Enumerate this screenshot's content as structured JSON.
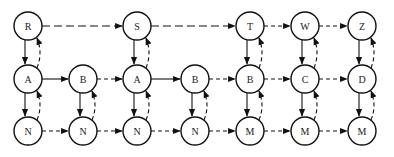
{
  "diagram": {
    "node_radius": 14,
    "nodes": [
      {
        "id": "r1c1",
        "label": "R",
        "x": 28,
        "y": 26
      },
      {
        "id": "r1c3",
        "label": "S",
        "x": 137,
        "y": 26
      },
      {
        "id": "r1c5",
        "label": "T",
        "x": 250,
        "y": 26
      },
      {
        "id": "r1c6",
        "label": "W",
        "x": 305,
        "y": 26
      },
      {
        "id": "r1c7",
        "label": "Z",
        "x": 362,
        "y": 26
      },
      {
        "id": "r2c1",
        "label": "A",
        "x": 28,
        "y": 79
      },
      {
        "id": "r2c2",
        "label": "B",
        "x": 83,
        "y": 79
      },
      {
        "id": "r2c3",
        "label": "A",
        "x": 137,
        "y": 79
      },
      {
        "id": "r2c4",
        "label": "B",
        "x": 195,
        "y": 79
      },
      {
        "id": "r2c5",
        "label": "B",
        "x": 250,
        "y": 79
      },
      {
        "id": "r2c6",
        "label": "C",
        "x": 305,
        "y": 79
      },
      {
        "id": "r2c7",
        "label": "D",
        "x": 362,
        "y": 79
      },
      {
        "id": "r3c1",
        "label": "N",
        "x": 28,
        "y": 131
      },
      {
        "id": "r3c2",
        "label": "N",
        "x": 83,
        "y": 131
      },
      {
        "id": "r3c3",
        "label": "N",
        "x": 137,
        "y": 131
      },
      {
        "id": "r3c4",
        "label": "N",
        "x": 195,
        "y": 131
      },
      {
        "id": "r3c5",
        "label": "M",
        "x": 250,
        "y": 131
      },
      {
        "id": "r3c6",
        "label": "M",
        "x": 305,
        "y": 131
      },
      {
        "id": "r3c7",
        "label": "M",
        "x": 362,
        "y": 131
      }
    ],
    "edges": [
      {
        "from": "r1c1",
        "to": "r1c3",
        "style": "long-dash",
        "kind": "horizontal"
      },
      {
        "from": "r1c3",
        "to": "r1c5",
        "style": "long-dash",
        "kind": "horizontal"
      },
      {
        "from": "r1c5",
        "to": "r1c6",
        "style": "short-dash",
        "kind": "horizontal"
      },
      {
        "from": "r1c6",
        "to": "r1c7",
        "style": "short-dash",
        "kind": "horizontal"
      },
      {
        "from": "r2c1",
        "to": "r2c2",
        "style": "solid",
        "kind": "horizontal"
      },
      {
        "from": "r2c2",
        "to": "r2c3",
        "style": "short-dash",
        "kind": "horizontal"
      },
      {
        "from": "r2c3",
        "to": "r2c4",
        "style": "solid",
        "kind": "horizontal"
      },
      {
        "from": "r2c4",
        "to": "r2c5",
        "style": "short-dash",
        "kind": "horizontal"
      },
      {
        "from": "r2c5",
        "to": "r2c6",
        "style": "short-dash",
        "kind": "horizontal"
      },
      {
        "from": "r2c6",
        "to": "r2c7",
        "style": "short-dash",
        "kind": "horizontal"
      },
      {
        "from": "r3c1",
        "to": "r3c2",
        "style": "short-dash",
        "kind": "horizontal"
      },
      {
        "from": "r3c2",
        "to": "r3c3",
        "style": "short-dash",
        "kind": "horizontal"
      },
      {
        "from": "r3c3",
        "to": "r3c4",
        "style": "short-dash",
        "kind": "horizontal"
      },
      {
        "from": "r3c4",
        "to": "r3c5",
        "style": "short-dash",
        "kind": "horizontal"
      },
      {
        "from": "r3c5",
        "to": "r3c6",
        "style": "short-dash",
        "kind": "horizontal"
      },
      {
        "from": "r3c6",
        "to": "r3c7",
        "style": "short-dash",
        "kind": "horizontal"
      },
      {
        "from": "r1c1",
        "to": "r2c1",
        "style": "solid",
        "kind": "down"
      },
      {
        "from": "r2c1",
        "to": "r1c1",
        "style": "curve-dash",
        "kind": "up"
      },
      {
        "from": "r2c1",
        "to": "r3c1",
        "style": "solid",
        "kind": "down"
      },
      {
        "from": "r3c1",
        "to": "r2c1",
        "style": "curve-dash",
        "kind": "up"
      },
      {
        "from": "r2c2",
        "to": "r3c2",
        "style": "solid",
        "kind": "down"
      },
      {
        "from": "r3c2",
        "to": "r2c2",
        "style": "curve-dash",
        "kind": "up"
      },
      {
        "from": "r1c3",
        "to": "r2c3",
        "style": "solid",
        "kind": "down"
      },
      {
        "from": "r2c3",
        "to": "r1c3",
        "style": "curve-dash",
        "kind": "up"
      },
      {
        "from": "r2c3",
        "to": "r3c3",
        "style": "solid",
        "kind": "down"
      },
      {
        "from": "r3c3",
        "to": "r2c3",
        "style": "curve-dash",
        "kind": "up"
      },
      {
        "from": "r2c4",
        "to": "r3c4",
        "style": "solid",
        "kind": "down"
      },
      {
        "from": "r3c4",
        "to": "r2c4",
        "style": "curve-dash",
        "kind": "up"
      },
      {
        "from": "r1c5",
        "to": "r2c5",
        "style": "solid",
        "kind": "down"
      },
      {
        "from": "r2c5",
        "to": "r1c5",
        "style": "curve-dash",
        "kind": "up"
      },
      {
        "from": "r2c5",
        "to": "r3c5",
        "style": "solid",
        "kind": "down"
      },
      {
        "from": "r3c5",
        "to": "r2c5",
        "style": "curve-dash",
        "kind": "up"
      },
      {
        "from": "r1c6",
        "to": "r2c6",
        "style": "solid",
        "kind": "down"
      },
      {
        "from": "r2c6",
        "to": "r1c6",
        "style": "curve-dash",
        "kind": "up"
      },
      {
        "from": "r2c6",
        "to": "r3c6",
        "style": "solid",
        "kind": "down"
      },
      {
        "from": "r3c6",
        "to": "r2c6",
        "style": "curve-dash",
        "kind": "up"
      },
      {
        "from": "r1c7",
        "to": "r2c7",
        "style": "solid",
        "kind": "down"
      },
      {
        "from": "r2c7",
        "to": "r1c7",
        "style": "curve-dash",
        "kind": "up"
      },
      {
        "from": "r2c7",
        "to": "r3c7",
        "style": "solid",
        "kind": "down"
      },
      {
        "from": "r3c7",
        "to": "r2c7",
        "style": "curve-dash",
        "kind": "up"
      }
    ]
  }
}
